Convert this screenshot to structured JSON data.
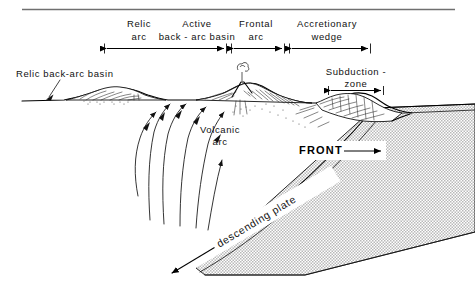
{
  "figure": {
    "title_rule": "horizontal-rule",
    "background": "#ffffff",
    "ink": "#111111",
    "slab_fill": "#d8d8d8"
  },
  "zone_labels": [
    {
      "id": "relic-arc",
      "line1": "Relic",
      "line2": "arc"
    },
    {
      "id": "active-back-arc-basin",
      "line1": "Active",
      "line2": "back - arc basin"
    },
    {
      "id": "frontal-arc",
      "line1": "Frontal",
      "line2": "arc"
    },
    {
      "id": "accretionary-wedge",
      "line1": "Accretionary",
      "line2": "wedge"
    }
  ],
  "callouts": {
    "relic_back_arc_basin": "Relic back-arc basin",
    "volcanic_arc_line1": "Volcanic",
    "volcanic_arc_line2": "arc",
    "subduction_zone_line1": "Subduction -",
    "subduction_zone_line2": "zone",
    "front": "FRONT",
    "descending_plate": "descending plate"
  },
  "icons": {
    "front_arrow": "arrow-right-icon",
    "slab_arrow": "arrow-left-icon",
    "mantle_flow": "upwelling-arrow-icon",
    "leader": "leader-line-icon",
    "smoke": "volcano-plume-icon"
  }
}
